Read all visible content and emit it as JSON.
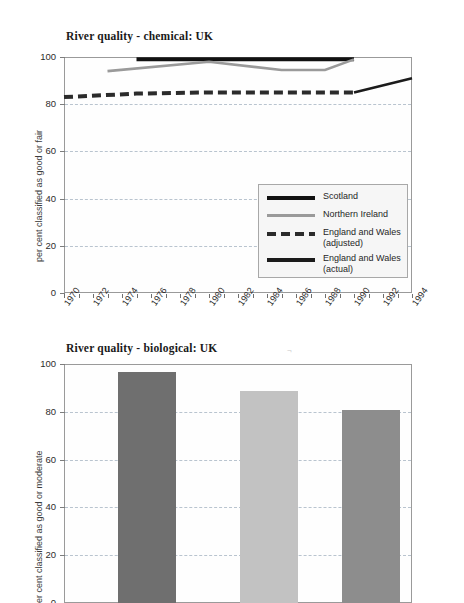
{
  "page": {
    "background": "#ffffff",
    "width": 464,
    "height": 603
  },
  "figures": [
    {
      "id": "chemical",
      "title": "River quality - chemical: UK",
      "ylabel": "per cent classified as good or fair"
    },
    {
      "id": "biological",
      "title": "River quality - biological: UK",
      "ylabel": "per cent classified as good or moderate"
    }
  ],
  "legend": {
    "entries": [
      {
        "label": "Scotland",
        "style": "solid-thick",
        "color": "#111111"
      },
      {
        "label": "Northern Ireland",
        "style": "solid-gray",
        "color": "#9a9a9a"
      },
      {
        "label": "England and Wales\n(adjusted)",
        "style": "dashed",
        "color": "#2b2b2b"
      },
      {
        "label": "England and Wales\n(actual)",
        "style": "solid-black",
        "color": "#1b1b1b"
      }
    ]
  },
  "yticks": [
    "0",
    "20",
    "40",
    "60",
    "80",
    "100"
  ],
  "xticks_labelled": [
    "1970",
    "1972",
    "1974",
    "1976",
    "1978",
    "1980",
    "1982",
    "1984",
    "1986",
    "1988",
    "1990",
    "1992",
    "1994"
  ],
  "chart_data": [
    {
      "type": "line",
      "title": "River quality - chemical: UK",
      "xlabel": "",
      "ylabel": "per cent classified as good or fair",
      "xlim": [
        1970,
        1994
      ],
      "ylim": [
        0,
        100
      ],
      "yticks": [
        0,
        20,
        40,
        60,
        80,
        100
      ],
      "xticks": [
        1970,
        1971,
        1972,
        1973,
        1974,
        1975,
        1976,
        1977,
        1978,
        1979,
        1980,
        1981,
        1982,
        1983,
        1984,
        1985,
        1986,
        1987,
        1988,
        1989,
        1990,
        1991,
        1992,
        1993,
        1994
      ],
      "xtick_labels": [
        1970,
        1972,
        1974,
        1976,
        1978,
        1980,
        1982,
        1984,
        1986,
        1988,
        1990,
        1992,
        1994
      ],
      "grid": "horizontal-dashed",
      "legend_position": "inside-right-lower",
      "series": [
        {
          "name": "Scotland",
          "style": "solid-thick",
          "color": "#111111",
          "x": [
            1975,
            1980,
            1985,
            1990
          ],
          "values": [
            99,
            99,
            99,
            99
          ]
        },
        {
          "name": "Northern Ireland",
          "style": "solid",
          "color": "#9a9a9a",
          "x": [
            1973,
            1980,
            1985,
            1988,
            1990
          ],
          "values": [
            94,
            98,
            94.5,
            94.5,
            99
          ]
        },
        {
          "name": "England and Wales (adjusted)",
          "style": "dashed",
          "color": "#2b2b2b",
          "x": [
            1970,
            1975,
            1980,
            1985,
            1990
          ],
          "values": [
            83,
            84.5,
            85,
            85,
            85
          ]
        },
        {
          "name": "England and Wales (actual)",
          "style": "solid",
          "color": "#1b1b1b",
          "x": [
            1990,
            1994
          ],
          "values": [
            85,
            91
          ]
        }
      ]
    },
    {
      "type": "bar",
      "title": "River quality - biological: UK",
      "xlabel": "",
      "ylabel": "per cent classified as good or moderate",
      "ylim": [
        0,
        100
      ],
      "yticks": [
        0,
        20,
        40,
        60,
        80,
        100
      ],
      "grid": "horizontal-dashed",
      "categories": [
        "",
        "",
        ""
      ],
      "values": [
        97,
        89,
        81
      ],
      "colors": [
        "#6f6f6f",
        "#c2c2c2",
        "#8d8d8d"
      ]
    }
  ],
  "artifact": {
    "mark": "¬"
  }
}
